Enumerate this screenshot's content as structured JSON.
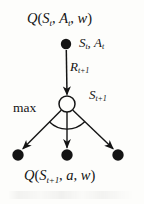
{
  "figure": {
    "title_text": "Q(S_t, A_t, w)",
    "kind": "q-learning-backup-diagram",
    "background_color": "#fdfdfb",
    "ink_color": "#141414"
  },
  "labels": {
    "q_top": {
      "name": "Q",
      "open_paren": "(",
      "state": "S",
      "state_sub": "t",
      "comma1": ", ",
      "action": "A",
      "action_sub": "t",
      "comma2": ", ",
      "weights": "w",
      "close_paren": ")",
      "plain": "Q(S_t, A_t, w)"
    },
    "state_action": {
      "state": "S",
      "state_sub": "t",
      "comma": ", ",
      "action": "A",
      "action_sub": "t",
      "plain": "S_t, A_t"
    },
    "reward": {
      "symbol": "R",
      "sub": "t+1",
      "plain": "R_t+1"
    },
    "next_state": {
      "symbol": "S",
      "sub": "t+1",
      "plain": "S_t+1"
    },
    "max": {
      "text": "max"
    },
    "q_bottom": {
      "name": "Q",
      "open_paren": "(",
      "state": "S",
      "state_sub": "t+1",
      "comma1": ", ",
      "action": "a",
      "comma2": ", ",
      "weights": "w",
      "close_paren": ")",
      "plain": "Q(S_t+1, a, w)"
    }
  },
  "nodes": {
    "root": {
      "type": "filled-circle",
      "x": 66,
      "y": 44,
      "r": 5.2,
      "semantic": "state-action-node"
    },
    "next_state": {
      "type": "open-circle",
      "x": 67,
      "y": 104,
      "r": 8.0,
      "semantic": "next-state-node"
    },
    "leaves": [
      {
        "type": "filled-circle",
        "x": 18,
        "y": 155,
        "r": 5.6,
        "semantic": "leaf-action-node-left"
      },
      {
        "type": "filled-circle",
        "x": 67,
        "y": 155,
        "r": 5.6,
        "semantic": "leaf-action-node-center"
      },
      {
        "type": "filled-circle",
        "x": 118,
        "y": 155,
        "r": 5.6,
        "semantic": "leaf-action-node-right"
      }
    ]
  },
  "edges": {
    "reward_arrow": {
      "from": [
        66,
        50
      ],
      "to": [
        67,
        95
      ],
      "arrow": true
    },
    "branch_left": {
      "from": [
        61,
        111
      ],
      "to": [
        23,
        149
      ],
      "arrow": true
    },
    "branch_center": {
      "from": [
        67,
        112
      ],
      "to": [
        67,
        148
      ],
      "arrow": true
    },
    "branch_right": {
      "from": [
        73,
        111
      ],
      "to": [
        113,
        149
      ],
      "arrow": true
    },
    "max_arc": {
      "center": [
        67,
        104
      ],
      "radius": 25,
      "start_deg": 135,
      "end_deg": 45
    }
  }
}
